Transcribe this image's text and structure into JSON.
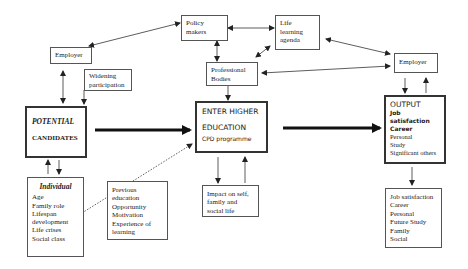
{
  "nodes": {
    "employer_left": {
      "label": "Employer"
    },
    "widening": {
      "lines": [
        "Widening",
        "participation"
      ]
    },
    "policy": {
      "lines": [
        "Policy",
        "makers"
      ]
    },
    "life_learning": {
      "lines": [
        "Life",
        "learning",
        "agenda"
      ]
    },
    "professional": {
      "lines": [
        "Professional",
        "Bodies"
      ]
    },
    "employer_right": {
      "label": "Employer"
    },
    "potential": {
      "lines": [
        "POTENTIAL",
        "CANDIDATES"
      ]
    },
    "enter_he": {
      "lines": [
        "ENTER HIGHER",
        "EDUCATION",
        "CPD programme"
      ]
    },
    "output": {
      "title": "OUTPUT",
      "bold_lines": [
        "Job",
        "satisfaction",
        "Career"
      ],
      "lines": [
        "Personal",
        "Study",
        "Significant others"
      ]
    },
    "individual": {
      "title": "Individual",
      "lines": [
        "Age",
        "Family role",
        "Lifespan",
        "development",
        "Life crises",
        "Social class"
      ]
    },
    "previous": {
      "lines": [
        "Previous",
        "education",
        "Opportunity",
        "Motivation",
        "Experience of",
        "learning"
      ]
    },
    "impact": {
      "lines": [
        "Impact on self,",
        "family and",
        "social life"
      ]
    },
    "outcomes": {
      "lines": [
        "Job satisfaction",
        "Career",
        "Personal",
        "Future Study",
        "Family",
        "Social"
      ]
    }
  },
  "edges": [
    {
      "from": "employer_left",
      "to": "policy",
      "type": "bidirectional"
    },
    {
      "from": "policy",
      "to": "life_learning",
      "type": "bidirectional"
    },
    {
      "from": "policy",
      "to": "professional",
      "type": "bidirectional"
    },
    {
      "from": "life_learning",
      "to": "professional",
      "type": "bidirectional"
    },
    {
      "from": "life_learning",
      "to": "employer_right",
      "type": "bidirectional"
    },
    {
      "from": "employer_right",
      "to": "professional",
      "type": "bidirectional"
    },
    {
      "from": "employer_left",
      "to": "potential",
      "type": "bidirectional"
    },
    {
      "from": "widening",
      "to": "potential",
      "type": "directed"
    },
    {
      "from": "professional",
      "to": "enter_he",
      "type": "directed"
    },
    {
      "from": "employer_right",
      "to": "output",
      "type": "bidirectional-pair"
    },
    {
      "from": "potential",
      "to": "enter_he",
      "type": "thick"
    },
    {
      "from": "enter_he",
      "to": "output",
      "type": "thick"
    },
    {
      "from": "potential",
      "to": "individual",
      "type": "bidirectional-pair"
    },
    {
      "from": "individual",
      "to": "enter_he",
      "type": "dotted"
    },
    {
      "from": "enter_he",
      "to": "impact",
      "type": "bidirectional-pair"
    },
    {
      "from": "output",
      "to": "outcomes",
      "type": "directed"
    }
  ]
}
